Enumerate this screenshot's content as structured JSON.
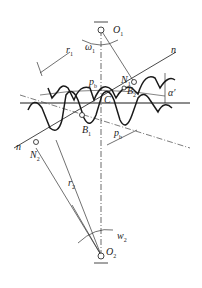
{
  "diagram": {
    "labels": {
      "O1": "O",
      "O1_sub": "1",
      "omega1": "ω",
      "omega1_sub": "1",
      "r1p": "r",
      "r1p_sub": "1",
      "r1p_sup": "′",
      "n_top": "n",
      "N1": "N",
      "N1_sub": "1",
      "B2": "B",
      "B2_sub": "2",
      "alpha": "α′",
      "pb": "p",
      "pb_sub": "b",
      "C": "C",
      "B1": "B",
      "B1_sub": "1",
      "pb2": "p",
      "pb2_sub": "b",
      "n_bottom": "n",
      "N2": "N",
      "N2_sub": "2",
      "r2p": "r",
      "r2p_sub": "2",
      "r2p_sup": "′",
      "w2": "w",
      "w2_sub": "2",
      "O2": "O",
      "O2_sub": "2"
    },
    "colors": {
      "line": "#1a1a1a",
      "thin": "#333333",
      "background": "#ffffff"
    }
  }
}
